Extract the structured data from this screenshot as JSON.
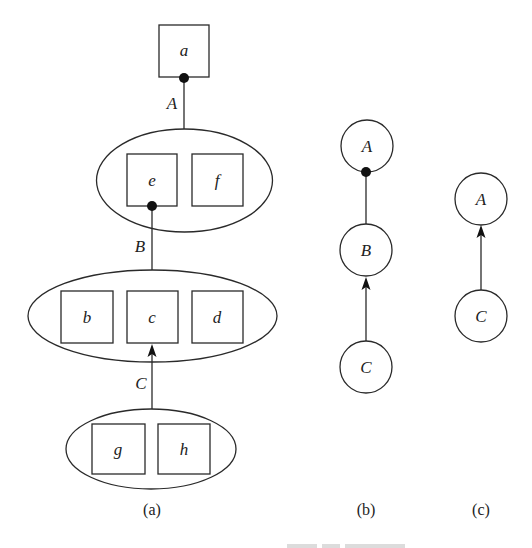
{
  "diagram": {
    "panel_a": {
      "sublabel": "(a)",
      "top_box": {
        "label": "a"
      },
      "group1": {
        "boxes": [
          {
            "label": "e"
          },
          {
            "label": "f"
          }
        ]
      },
      "group2": {
        "boxes": [
          {
            "label": "b"
          },
          {
            "label": "c"
          },
          {
            "label": "d"
          }
        ]
      },
      "group3": {
        "boxes": [
          {
            "label": "g"
          },
          {
            "label": "h"
          }
        ]
      },
      "edges": [
        {
          "label": "A",
          "from": "group1",
          "to": "a",
          "end": "dot"
        },
        {
          "label": "B",
          "from": "group2",
          "to": "e",
          "end": "dot"
        },
        {
          "label": "C",
          "from": "group3",
          "to": "c",
          "end": "arrow"
        }
      ]
    },
    "panel_b": {
      "sublabel": "(b)",
      "nodes": [
        {
          "label": "A"
        },
        {
          "label": "B"
        },
        {
          "label": "C"
        }
      ],
      "edges": [
        {
          "from": "B",
          "to": "A",
          "end": "dot"
        },
        {
          "from": "C",
          "to": "B",
          "end": "arrow"
        }
      ]
    },
    "panel_c": {
      "sublabel": "(c)",
      "nodes": [
        {
          "label": "A"
        },
        {
          "label": "C"
        }
      ],
      "edges": [
        {
          "from": "C",
          "to": "A",
          "end": "arrow"
        }
      ]
    },
    "colors": {
      "stroke": "#2a2a2a",
      "fill": "#ffffff",
      "marker": "#111111"
    }
  }
}
